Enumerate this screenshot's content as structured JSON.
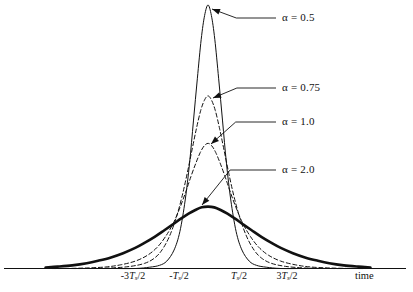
{
  "figure": {
    "axis_title": "time",
    "background_color": "#ffffff",
    "ink_color": "#111111"
  },
  "chart_data": {
    "type": "line",
    "title": "",
    "xlabel": "time",
    "ylabel": "",
    "grid": false,
    "legend_position": "inline-annotations",
    "x_tick_labels": [
      "-3Ts/2",
      "-Ts/2",
      "Ts/2",
      "3Ts/2"
    ],
    "x_tick_values": [
      -1.5,
      -0.5,
      0.5,
      1.5
    ],
    "x_unit": "Ts",
    "xlim": [
      -3.35,
      3.35
    ],
    "ylim": [
      0,
      1.06
    ],
    "series": [
      {
        "name": "α = 0.5",
        "alpha": 0.5,
        "style": "solid",
        "line_width": 1,
        "peak_value": 1.0,
        "peak_x": 0,
        "half_width_ts": 0.42,
        "x": [
          -3.35,
          -3.0,
          -2.5,
          -2.0,
          -1.5,
          -1.2,
          -1.0,
          -0.85,
          -0.7,
          -0.58,
          -0.47,
          -0.38,
          -0.3,
          -0.22,
          -0.14,
          -0.07,
          0,
          0.07,
          0.14,
          0.22,
          0.3,
          0.38,
          0.47,
          0.58,
          0.7,
          0.85,
          1.0,
          1.2,
          1.5,
          2.0,
          2.5,
          3.0,
          3.35
        ],
        "y": [
          0.0,
          0.0,
          0.0,
          0.0,
          0.0,
          0.005,
          0.012,
          0.028,
          0.07,
          0.14,
          0.26,
          0.4,
          0.56,
          0.72,
          0.87,
          0.96,
          1.0,
          0.96,
          0.87,
          0.72,
          0.56,
          0.4,
          0.26,
          0.14,
          0.07,
          0.028,
          0.012,
          0.005,
          0.0,
          0.0,
          0.0,
          0.0,
          0.0
        ]
      },
      {
        "name": "α = 0.75",
        "alpha": 0.75,
        "style": "dashed",
        "line_width": 1,
        "peak_value": 0.655,
        "peak_x": 0,
        "half_width_ts": 0.5,
        "x": [
          -3.35,
          -3.0,
          -2.5,
          -2.0,
          -1.6,
          -1.3,
          -1.1,
          -0.95,
          -0.8,
          -0.66,
          -0.54,
          -0.43,
          -0.33,
          -0.24,
          -0.15,
          -0.07,
          0,
          0.07,
          0.15,
          0.24,
          0.33,
          0.43,
          0.54,
          0.66,
          0.8,
          0.95,
          1.1,
          1.3,
          1.6,
          2.0,
          2.5,
          3.0,
          3.35
        ],
        "y": [
          0.0,
          0.0,
          0.0,
          0.002,
          0.008,
          0.02,
          0.04,
          0.07,
          0.12,
          0.19,
          0.27,
          0.36,
          0.45,
          0.53,
          0.6,
          0.64,
          0.655,
          0.64,
          0.6,
          0.53,
          0.45,
          0.36,
          0.27,
          0.19,
          0.12,
          0.07,
          0.04,
          0.02,
          0.008,
          0.002,
          0.0,
          0.0,
          0.0
        ]
      },
      {
        "name": "α = 1.0",
        "alpha": 1.0,
        "style": "dashed",
        "line_width": 1,
        "peak_value": 0.475,
        "peak_x": 0,
        "half_width_ts": 0.6,
        "x": [
          -3.35,
          -3.0,
          -2.5,
          -2.1,
          -1.8,
          -1.5,
          -1.25,
          -1.05,
          -0.88,
          -0.72,
          -0.58,
          -0.46,
          -0.35,
          -0.25,
          -0.16,
          -0.08,
          0,
          0.08,
          0.16,
          0.25,
          0.35,
          0.46,
          0.58,
          0.72,
          0.88,
          1.05,
          1.25,
          1.5,
          1.8,
          2.1,
          2.5,
          3.0,
          3.35
        ],
        "y": [
          0.0,
          0.0,
          0.002,
          0.006,
          0.014,
          0.028,
          0.05,
          0.08,
          0.12,
          0.17,
          0.23,
          0.29,
          0.35,
          0.4,
          0.44,
          0.465,
          0.475,
          0.465,
          0.44,
          0.4,
          0.35,
          0.29,
          0.23,
          0.17,
          0.12,
          0.08,
          0.05,
          0.028,
          0.014,
          0.006,
          0.002,
          0.0,
          0.0
        ]
      },
      {
        "name": "α = 2.0",
        "alpha": 2.0,
        "style": "solid",
        "line_width": 2.6,
        "peak_value": 0.235,
        "peak_x": 0,
        "half_width_ts": 1.15,
        "x": [
          -3.35,
          -3.1,
          -2.8,
          -2.5,
          -2.25,
          -2.0,
          -1.75,
          -1.5,
          -1.3,
          -1.1,
          -0.9,
          -0.72,
          -0.55,
          -0.4,
          -0.26,
          -0.13,
          0,
          0.13,
          0.26,
          0.4,
          0.55,
          0.72,
          0.9,
          1.1,
          1.3,
          1.5,
          1.75,
          2.0,
          2.25,
          2.5,
          2.8,
          3.1,
          3.35
        ],
        "y": [
          0.004,
          0.007,
          0.012,
          0.02,
          0.03,
          0.042,
          0.058,
          0.078,
          0.098,
          0.12,
          0.145,
          0.168,
          0.19,
          0.208,
          0.222,
          0.232,
          0.235,
          0.232,
          0.222,
          0.208,
          0.19,
          0.168,
          0.145,
          0.12,
          0.098,
          0.078,
          0.058,
          0.042,
          0.03,
          0.02,
          0.012,
          0.007,
          0.004
        ]
      }
    ],
    "annotations": [
      {
        "text": "α = 0.5",
        "label_x": 282,
        "label_y": 18,
        "target_x": 212,
        "target_y": 9
      },
      {
        "text": "α = 0.75",
        "label_x": 282,
        "label_y": 88,
        "target_x": 213,
        "target_y": 98
      },
      {
        "text": "α = 1.0",
        "label_x": 282,
        "label_y": 122,
        "target_x": 211,
        "target_y": 144
      },
      {
        "text": "α = 2.0",
        "label_x": 282,
        "label_y": 170,
        "target_x": 202,
        "target_y": 205
      }
    ]
  }
}
